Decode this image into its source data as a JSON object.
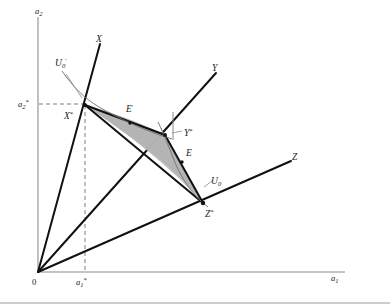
{
  "figure": {
    "background_color": "#ffffff",
    "shade_color": "#b3b3b3",
    "line_color": "#111111",
    "axis_color": "#8c8c8c"
  },
  "axes": {
    "y_axis_label": "a",
    "y_axis_label_sub": "2",
    "x_axis_label": "a",
    "x_axis_label_sub": "1",
    "origin_label": "0",
    "x_tick_label": "a",
    "x_tick_label_sub": "1",
    "x_tick_label_sup": "*",
    "y_tick_label": "a",
    "y_tick_label_sub": "2",
    "y_tick_label_sup": "*"
  },
  "rays": [
    {
      "name": "X",
      "label": "X"
    },
    {
      "name": "Y",
      "label": "Y"
    },
    {
      "name": "Z",
      "label": "Z"
    }
  ],
  "points": [
    {
      "name": "X-star",
      "label": "X",
      "sup": "*"
    },
    {
      "name": "Y-star",
      "label": "Y",
      "sup": "*"
    },
    {
      "name": "Z-star",
      "label": "Z",
      "sup": "*"
    },
    {
      "name": "E-prime",
      "label": "E",
      "sup": "'"
    },
    {
      "name": "E",
      "label": "E",
      "sup": ""
    }
  ],
  "curves": [
    {
      "name": "U0-prime",
      "label": "U",
      "sub": "0",
      "sup": "'"
    },
    {
      "name": "U0",
      "label": "U",
      "sub": "0",
      "sup": ""
    }
  ]
}
